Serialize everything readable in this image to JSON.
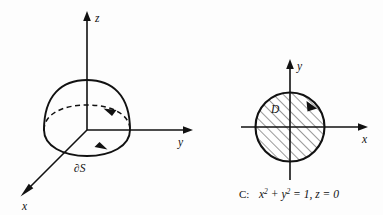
{
  "figure": {
    "background_color": "#fdfdfd",
    "ink_color": "#111111"
  },
  "left_panel": {
    "name": "hemisphere-3d-diagram",
    "axes": [
      {
        "id": "z",
        "label": "z",
        "direction": "up"
      },
      {
        "id": "y",
        "label": "y",
        "direction": "right"
      },
      {
        "id": "x",
        "label": "x",
        "direction": "down-left"
      }
    ],
    "surface": {
      "shape": "hemisphere-dome",
      "rim_back_style": "dashed",
      "rim_front_style": "solid"
    },
    "boundary_label": "∂S",
    "orientation_arrows": [
      {
        "id": "back-rim-arrow",
        "points": "left"
      },
      {
        "id": "front-rim-arrow",
        "points": "right"
      }
    ]
  },
  "right_panel": {
    "name": "disk-2d-diagram",
    "axes": [
      {
        "id": "y",
        "label": "y",
        "direction": "up"
      },
      {
        "id": "x",
        "label": "x",
        "direction": "right"
      }
    ],
    "region": {
      "label": "D",
      "shape": "disk",
      "fill": "diagonal-hatching",
      "radius_units": 1
    },
    "orientation_arrow": {
      "id": "circle-arrow",
      "direction": "counterclockwise"
    },
    "caption": {
      "curve_name": "C:",
      "equation_base1": "x",
      "equation_sup1": "2",
      "equation_plus": " + ",
      "equation_base2": "y",
      "equation_sup2": "2",
      "equation_tail": " = 1, z = 0",
      "full_text": "C:  x² + y² = 1, z = 0"
    }
  }
}
